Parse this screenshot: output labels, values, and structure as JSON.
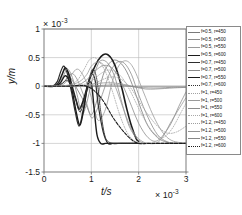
{
  "axes": {
    "y_axis_label": "y/m",
    "x_axis_label": "t/s",
    "y_multiplier": "× 10",
    "y_multiplier_exp": "-3",
    "x_multiplier": "× 10",
    "x_multiplier_exp": "-3",
    "y_ticks": [
      "1",
      "0.5",
      "0",
      "-0.5",
      "-1",
      "-1.5"
    ],
    "x_ticks": [
      "0",
      "1",
      "2",
      "3"
    ]
  },
  "legend": {
    "entries": [
      {
        "label": "f=0.5,  r=450",
        "style": "thin-gray",
        "color": "#7a7a7a"
      },
      {
        "label": "f=0.5,  r=500",
        "style": "thin-gray",
        "color": "#8d8d8d"
      },
      {
        "label": "f=0.5,  r=550",
        "style": "thin-gray",
        "color": "#9a9a9a"
      },
      {
        "label": "f=0.5,  r=600",
        "style": "thick-dark",
        "color": "#1c1c1c"
      },
      {
        "label": "f=0.7,  r=450",
        "style": "medium-dark",
        "color": "#2e2e2e"
      },
      {
        "label": "f=0.7,  r=500",
        "style": "thin-gray",
        "color": "#8a8a8a"
      },
      {
        "label": "f=0.7,  r=550",
        "style": "thick-dark",
        "color": "#1c1c1c"
      },
      {
        "label": "f=0.7,  r=600",
        "style": "dotted-dark",
        "color": "#333333"
      },
      {
        "label": "f=1,  r=450",
        "style": "dotted-gray",
        "color": "#a2a2a2"
      },
      {
        "label": "f=1,  r=500",
        "style": "thin-gray",
        "color": "#9a9a9a"
      },
      {
        "label": "f=1,  r=550",
        "style": "thin-gray",
        "color": "#8d8d8d"
      },
      {
        "label": "f=1,  r=600",
        "style": "dotted-gray",
        "color": "#a8a8a8"
      },
      {
        "label": "f=1.2,  r=450",
        "style": "dotted-gray",
        "color": "#9f9f9f"
      },
      {
        "label": "f=1.2,  r=500",
        "style": "thin-gray",
        "color": "#949494"
      },
      {
        "label": "f=1.2,  r=550",
        "style": "thin-gray",
        "color": "#888888"
      },
      {
        "label": "f=1.2,  r=600",
        "style": "thick-dark",
        "color": "#1c1c1c"
      }
    ]
  },
  "chart_data": {
    "type": "line",
    "title": "",
    "xlabel": "t/s",
    "ylabel": "y/m",
    "xlim": [
      0,
      3
    ],
    "ylim": [
      -1.5,
      1
    ],
    "x_scale_factor": 0.001,
    "y_scale_factor": 0.001,
    "grid": true,
    "legend_position": "outside-right",
    "series": [
      {
        "name": "f=0.5,  r=450",
        "color": "#7a7a7a",
        "width": 0.8,
        "dash": "none",
        "x": [
          0,
          0.2,
          0.35,
          0.45,
          0.52,
          0.6,
          0.7,
          0.8,
          0.9,
          1.0,
          1.1,
          1.2,
          1.3,
          1.45,
          1.6,
          1.75,
          1.9,
          2.05,
          2.2,
          2.4,
          2.6,
          2.8,
          3.0
        ],
        "y": [
          0,
          0,
          0.02,
          0.1,
          0.18,
          0.1,
          -0.05,
          -0.2,
          -0.35,
          -0.5,
          -0.3,
          0.05,
          0.3,
          0.45,
          0.42,
          0.25,
          -0.05,
          -0.4,
          -0.7,
          -0.9,
          -0.98,
          -1.0,
          -1.0
        ]
      },
      {
        "name": "f=0.5,  r=500",
        "color": "#8d8d8d",
        "width": 0.8,
        "dash": "none",
        "x": [
          0,
          0.25,
          0.4,
          0.5,
          0.6,
          0.7,
          0.8,
          0.9,
          1.0,
          1.1,
          1.25,
          1.4,
          1.55,
          1.7,
          1.85,
          2.0,
          2.2,
          2.4,
          2.6,
          2.8,
          3.0
        ],
        "y": [
          0,
          0,
          0.05,
          0.15,
          0.22,
          0.12,
          -0.08,
          -0.3,
          -0.55,
          -0.45,
          -0.1,
          0.25,
          0.42,
          0.4,
          0.2,
          -0.15,
          -0.55,
          -0.85,
          -0.97,
          -1.0,
          -1.0
        ]
      },
      {
        "name": "f=0.5,  r=550",
        "color": "#9a9a9a",
        "width": 0.8,
        "dash": "none",
        "x": [
          0,
          0.3,
          0.45,
          0.58,
          0.7,
          0.82,
          0.95,
          1.05,
          1.15,
          1.3,
          1.45,
          1.6,
          1.75,
          1.9,
          2.1,
          2.3,
          2.5,
          2.7,
          3.0
        ],
        "y": [
          0,
          0,
          0.06,
          0.2,
          0.3,
          0.2,
          -0.05,
          -0.35,
          -0.6,
          -0.4,
          0.1,
          0.38,
          0.44,
          0.3,
          -0.1,
          -0.5,
          -0.8,
          -0.95,
          -1.0
        ]
      },
      {
        "name": "f=0.5,  r=600",
        "color": "#1c1c1c",
        "width": 1.6,
        "dash": "none",
        "x": [
          0,
          0.2,
          0.3,
          0.38,
          0.45,
          0.52,
          0.6,
          0.68,
          0.75,
          0.85,
          0.95,
          1.05,
          1.15,
          1.25,
          1.35,
          1.45,
          1.55,
          1.65,
          1.75,
          1.85,
          1.95,
          2.0
        ],
        "y": [
          0,
          0,
          0.05,
          0.2,
          0.32,
          0.22,
          -0.02,
          -0.25,
          -0.4,
          -0.2,
          0.1,
          0.3,
          0.46,
          0.55,
          0.55,
          0.45,
          0.25,
          -0.05,
          -0.4,
          -0.7,
          -0.92,
          -0.96
        ]
      },
      {
        "name": "f=0.7,  r=450",
        "color": "#2e2e2e",
        "width": 1.2,
        "dash": "none",
        "x": [
          0,
          0.18,
          0.28,
          0.35,
          0.42,
          0.5,
          0.58,
          0.66,
          0.74,
          0.82,
          0.9,
          1.0,
          1.08,
          1.15,
          1.25,
          1.35,
          1.45,
          1.55,
          1.7,
          1.85,
          2.0
        ],
        "y": [
          0,
          0,
          0.08,
          0.25,
          0.35,
          0.2,
          -0.1,
          -0.45,
          -0.7,
          -0.45,
          -0.1,
          0.2,
          0.1,
          -0.35,
          -0.8,
          -1.0,
          -1.0,
          -1.0,
          -1.0,
          -1.0,
          -1.0
        ]
      },
      {
        "name": "f=0.7,  r=500",
        "color": "#8a8a8a",
        "width": 0.8,
        "dash": "none",
        "x": [
          0,
          0.2,
          0.32,
          0.42,
          0.5,
          0.6,
          0.7,
          0.8,
          0.9,
          1.0,
          1.1,
          1.2,
          1.35,
          1.5,
          1.65,
          1.8,
          2.0,
          2.2,
          2.5,
          3.0
        ],
        "y": [
          0,
          0,
          0.06,
          0.2,
          0.3,
          0.15,
          -0.15,
          -0.5,
          -0.3,
          0.05,
          0.3,
          0.45,
          0.4,
          0.15,
          -0.3,
          -0.7,
          -0.95,
          -1.0,
          -1.0,
          -1.0
        ]
      },
      {
        "name": "f=0.7,  r=550",
        "color": "#1c1c1c",
        "width": 1.4,
        "dash": "none",
        "x": [
          0,
          0.22,
          0.34,
          0.44,
          0.52,
          0.6,
          0.68,
          0.76,
          0.84,
          0.92,
          1.0,
          1.06,
          1.12,
          1.2,
          1.3,
          1.4,
          1.5,
          1.6,
          1.8,
          2.0
        ],
        "y": [
          0,
          0,
          0.05,
          0.18,
          0.12,
          -0.1,
          -0.45,
          -0.68,
          -0.4,
          0.0,
          0.05,
          -0.4,
          -0.85,
          -1.0,
          -1.0,
          -1.0,
          -1.0,
          -1.0,
          -1.0,
          -1.0
        ]
      },
      {
        "name": "f=0.7,  r=600",
        "color": "#333333",
        "width": 1.0,
        "dash": "1,1",
        "x": [
          0,
          0.25,
          0.38,
          0.48,
          0.56,
          0.66,
          0.76,
          0.86,
          0.96,
          1.04,
          1.12,
          1.2,
          1.3,
          1.45,
          1.6,
          1.8,
          2.0,
          2.3,
          2.6,
          3.0
        ],
        "y": [
          0,
          0,
          0.05,
          0.1,
          0.02,
          -0.2,
          -0.45,
          -0.2,
          0.15,
          0.3,
          0.1,
          -0.45,
          -0.9,
          -1.0,
          -1.0,
          -1.0,
          -1.0,
          -1.0,
          -1.0,
          -1.0
        ]
      },
      {
        "name": "f=1,  r=450",
        "color": "#a2a2a2",
        "width": 0.8,
        "dash": "1,1.5",
        "x": [
          0,
          0.3,
          0.5,
          0.7,
          0.85,
          0.95,
          1.05,
          1.15,
          1.3,
          1.45,
          1.6,
          1.75,
          1.9,
          2.1,
          2.3,
          2.6,
          3.0
        ],
        "y": [
          0,
          0,
          0.02,
          0.1,
          0.3,
          0.45,
          0.5,
          0.45,
          0.25,
          -0.1,
          -0.5,
          -0.8,
          -0.95,
          -1.0,
          -1.0,
          -1.0,
          -1.0
        ]
      },
      {
        "name": "f=1,  r=500",
        "color": "#9a9a9a",
        "width": 0.8,
        "dash": "none",
        "x": [
          0,
          0.35,
          0.55,
          0.75,
          0.9,
          1.0,
          1.12,
          1.25,
          1.4,
          1.55,
          1.7,
          1.85,
          2.0,
          2.2,
          2.45,
          2.7,
          3.0
        ],
        "y": [
          0,
          0,
          0.02,
          0.08,
          0.2,
          0.35,
          0.42,
          0.38,
          0.2,
          -0.1,
          -0.45,
          -0.75,
          -0.92,
          -1.0,
          -0.95,
          -0.6,
          -0.2
        ]
      },
      {
        "name": "f=1,  r=550",
        "color": "#8d8d8d",
        "width": 0.8,
        "dash": "none",
        "x": [
          0,
          0.4,
          0.6,
          0.8,
          0.95,
          1.1,
          1.25,
          1.4,
          1.55,
          1.7,
          1.85,
          2.0,
          2.2,
          2.4,
          2.65,
          2.85,
          3.0
        ],
        "y": [
          0,
          0,
          0.0,
          0.05,
          0.15,
          0.28,
          0.36,
          0.34,
          0.2,
          -0.05,
          -0.35,
          -0.65,
          -0.9,
          -0.95,
          -0.7,
          -0.35,
          -0.1
        ]
      },
      {
        "name": "f=1,  r=600",
        "color": "#a8a8a8",
        "width": 0.8,
        "dash": "1,1.5",
        "x": [
          0,
          0.45,
          0.7,
          0.9,
          1.05,
          1.2,
          1.35,
          1.5,
          1.65,
          1.8,
          1.95,
          2.1,
          2.3,
          2.5,
          2.7,
          2.9,
          3.0
        ],
        "y": [
          0,
          0,
          0.0,
          0.05,
          0.12,
          0.22,
          0.28,
          0.26,
          0.15,
          -0.05,
          -0.3,
          -0.55,
          -0.8,
          -0.9,
          -0.75,
          -0.45,
          -0.3
        ]
      },
      {
        "name": "f=1.2,  r=450",
        "color": "#9f9f9f",
        "width": 0.8,
        "dash": "1,1.5",
        "x": [
          0,
          0.5,
          0.75,
          0.95,
          1.1,
          1.25,
          1.4,
          1.55,
          1.7,
          1.85,
          2.0,
          2.2,
          2.4,
          2.6,
          2.8,
          3.0
        ],
        "y": [
          0,
          0,
          0.0,
          0.02,
          0.06,
          0.12,
          0.16,
          0.15,
          0.08,
          -0.05,
          -0.25,
          -0.5,
          -0.7,
          -0.82,
          -0.8,
          -0.7
        ]
      },
      {
        "name": "f=1.2,  r=500",
        "color": "#949494",
        "width": 0.8,
        "dash": "none",
        "x": [
          0,
          0.3,
          0.6,
          0.9,
          1.15,
          1.35,
          1.55,
          1.75,
          1.95,
          2.15,
          2.35,
          2.55,
          2.75,
          3.0
        ],
        "y": [
          0,
          0,
          0.0,
          0.02,
          0.05,
          0.06,
          0.05,
          0.02,
          -0.02,
          -0.05,
          -0.05,
          -0.04,
          -0.03,
          -0.02
        ]
      },
      {
        "name": "f=1.2,  r=550",
        "color": "#888888",
        "width": 0.8,
        "dash": "none",
        "x": [
          0,
          0.4,
          0.8,
          1.1,
          1.4,
          1.6,
          1.8,
          2.0,
          2.2,
          2.45,
          2.7,
          3.0
        ],
        "y": [
          0,
          0,
          0.0,
          0.01,
          0.02,
          0.02,
          0.0,
          -0.02,
          -0.03,
          -0.03,
          -0.02,
          -0.02
        ]
      },
      {
        "name": "f=1.2,  r=600",
        "color": "#1c1c1c",
        "width": 1.1,
        "dash": "3,1.5",
        "x": [
          0,
          0.5,
          0.9,
          1.2,
          1.5,
          1.8,
          2.0,
          2.2,
          2.45,
          2.7,
          3.0
        ],
        "y": [
          0,
          0,
          0.0,
          -0.2,
          -0.6,
          -0.9,
          -1.0,
          -1.0,
          -1.0,
          -1.0,
          -1.0
        ]
      }
    ]
  }
}
